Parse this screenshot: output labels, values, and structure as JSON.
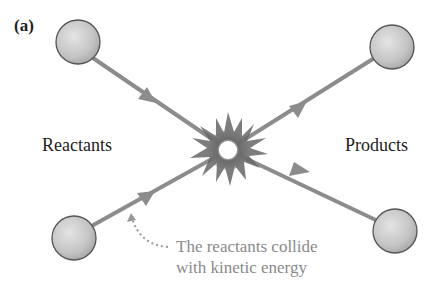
{
  "figure": {
    "panel_label": "(a)",
    "left_label": "Reactants",
    "right_label": "Products",
    "annotation_line1": "The reactants collide",
    "annotation_line2": "with kinetic energy"
  },
  "elements": {
    "reactant_particles": 2,
    "product_particles": 2,
    "collision_symbol": "starburst-icon"
  },
  "colors": {
    "arrow": "#8c8c8c",
    "particle_fill": "#c8c8c8",
    "particle_stroke": "#555555",
    "annotation_text": "#8a8a8a",
    "label_text": "#222222"
  }
}
